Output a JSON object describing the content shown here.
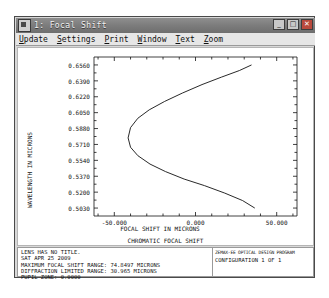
{
  "window": {
    "title": "1: Focal Shift",
    "system_icon": "system-menu-icon",
    "buttons": {
      "minimize": "_",
      "maximize": "□",
      "close": "✕"
    }
  },
  "menu": {
    "items": [
      {
        "label": "Update",
        "accel": "U"
      },
      {
        "label": "Settings",
        "accel": "S"
      },
      {
        "label": "Print",
        "accel": "P"
      },
      {
        "label": "Window",
        "accel": "W"
      },
      {
        "label": "Text",
        "accel": "T"
      },
      {
        "label": "Zoom",
        "accel": "Z"
      }
    ]
  },
  "chart_data": {
    "type": "line",
    "title": "",
    "subtitle": "CHROMATIC FOCAL SHIFT",
    "xlabel": "FOCAL SHIFT IN MICRONS",
    "ylabel": "WAVELENGTH IN MICRONS",
    "xlim": [
      -62.5,
      62.5
    ],
    "ylim": [
      0.4945,
      0.6645
    ],
    "grid": false,
    "legend": null,
    "xticks": [
      -50.0,
      0.0,
      50.0
    ],
    "xtick_labels": [
      "-50.000",
      "0.000",
      "50.000"
    ],
    "yticks": [
      0.656,
      0.639,
      0.622,
      0.605,
      0.588,
      0.571,
      0.554,
      0.537,
      0.52,
      0.503
    ],
    "ytick_labels": [
      "0.6560",
      "0.6390",
      "0.6220",
      "0.6050",
      "0.5880",
      "0.5710",
      "0.5540",
      "0.5370",
      "0.5200",
      "0.5030"
    ],
    "series": [
      {
        "name": "chromatic focal shift",
        "x": [
          34.5,
          27.0,
          16.0,
          4.0,
          -8.0,
          -19.0,
          -28.5,
          -35.5,
          -40.0,
          -41.5,
          -40.0,
          -35.5,
          -28.0,
          -18.5,
          -7.0,
          5.5,
          18.0,
          29.0,
          36.5
        ],
        "y": [
          0.656,
          0.65,
          0.643,
          0.635,
          0.626,
          0.617,
          0.608,
          0.599,
          0.589,
          0.578,
          0.568,
          0.559,
          0.55,
          0.542,
          0.534,
          0.527,
          0.519,
          0.511,
          0.503
        ]
      }
    ]
  },
  "footer": {
    "lines": [
      "LENS HAS NO TITLE.",
      "SAT APR 25 2009",
      "MAXIMUM FOCAL SHIFT RANGE: 74.8497 MICRONS",
      "DIFFRACTION LIMITED RANGE: 30.965 MICRONS",
      "PUPIL ZONE: 0.0000"
    ],
    "box_line1": "ZEMAX-EE  OPTICAL DESIGN PROGRAM",
    "box_line2": "CONFIGURATION 1 OF 1"
  }
}
